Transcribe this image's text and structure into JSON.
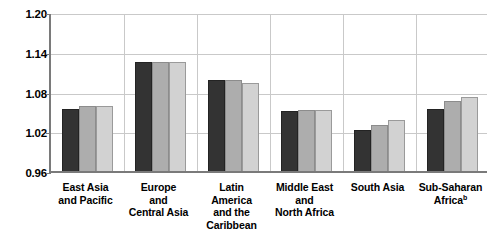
{
  "chart_data": {
    "type": "bar",
    "title": "",
    "xlabel": "",
    "ylabel": "",
    "ylim": [
      0.96,
      1.2
    ],
    "yticks": [
      "0.96",
      "1.02",
      "1.08",
      "1.14",
      "1.20"
    ],
    "ytick_values": [
      0.96,
      1.02,
      1.08,
      1.14,
      1.2
    ],
    "grid": true,
    "legend": "none",
    "categories": [
      "East Asia and Pacific",
      "Europe and Central Asia",
      "Latin America and the Caribbean",
      "Middle East and North Africa",
      "South Asia",
      "Sub-Saharan Africa"
    ],
    "category_lines": [
      [
        "East Asia",
        "and Pacific"
      ],
      [
        "Europe",
        "and",
        "Central Asia"
      ],
      [
        "Latin",
        "America",
        "and the",
        "Caribbean"
      ],
      [
        "Middle East",
        "and",
        "North Africa"
      ],
      [
        "South Asia"
      ],
      [
        "Sub-Saharan",
        "Africa"
      ]
    ],
    "category_footnotes": [
      "",
      "",
      "",
      "",
      "",
      "b"
    ],
    "series": [
      {
        "name": "series-1",
        "color": "#333333",
        "values": [
          1.053,
          1.124,
          1.097,
          1.05,
          1.022,
          1.053
        ]
      },
      {
        "name": "series-2",
        "color": "#adadad",
        "values": [
          1.058,
          1.124,
          1.097,
          1.052,
          1.03,
          1.065
        ]
      },
      {
        "name": "series-3",
        "color": "#d2d2d2",
        "values": [
          1.058,
          1.124,
          1.093,
          1.052,
          1.037,
          1.072
        ]
      }
    ]
  }
}
